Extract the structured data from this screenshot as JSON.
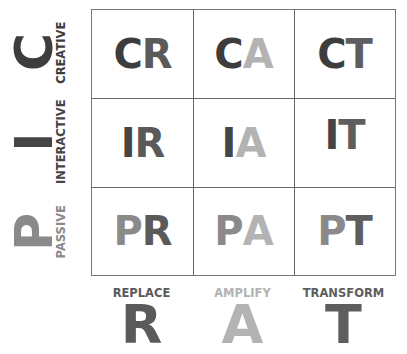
{
  "colors": {
    "passive": "#8a8a8a",
    "interactive": "#454545",
    "creative": "#3d3d3d",
    "replace": "#5a5a5a",
    "amplify": "#b3b3b3",
    "transform": "#5e5e5e"
  },
  "rows": [
    {
      "letter": "C",
      "label": "CREATIVE",
      "key": "creative"
    },
    {
      "letter": "I",
      "label": "INTERACTIVE",
      "key": "interactive"
    },
    {
      "letter": "P",
      "label": "PASSIVE",
      "key": "passive"
    }
  ],
  "columns": [
    {
      "letter": "R",
      "label": "REPLACE",
      "key": "replace"
    },
    {
      "letter": "A",
      "label": "AMPLIFY",
      "key": "amplify"
    },
    {
      "letter": "T",
      "label": "TRANSFORM",
      "key": "transform"
    }
  ],
  "cells": [
    [
      {
        "a": "C",
        "b": "R"
      },
      {
        "a": "C",
        "b": "A"
      },
      {
        "a": "C",
        "b": "T"
      }
    ],
    [
      {
        "a": "I",
        "b": "R"
      },
      {
        "a": "I",
        "b": "A"
      },
      {
        "a": "I",
        "b": "T"
      }
    ],
    [
      {
        "a": "P",
        "b": "R"
      },
      {
        "a": "P",
        "b": "A"
      },
      {
        "a": "P",
        "b": "T"
      }
    ]
  ]
}
